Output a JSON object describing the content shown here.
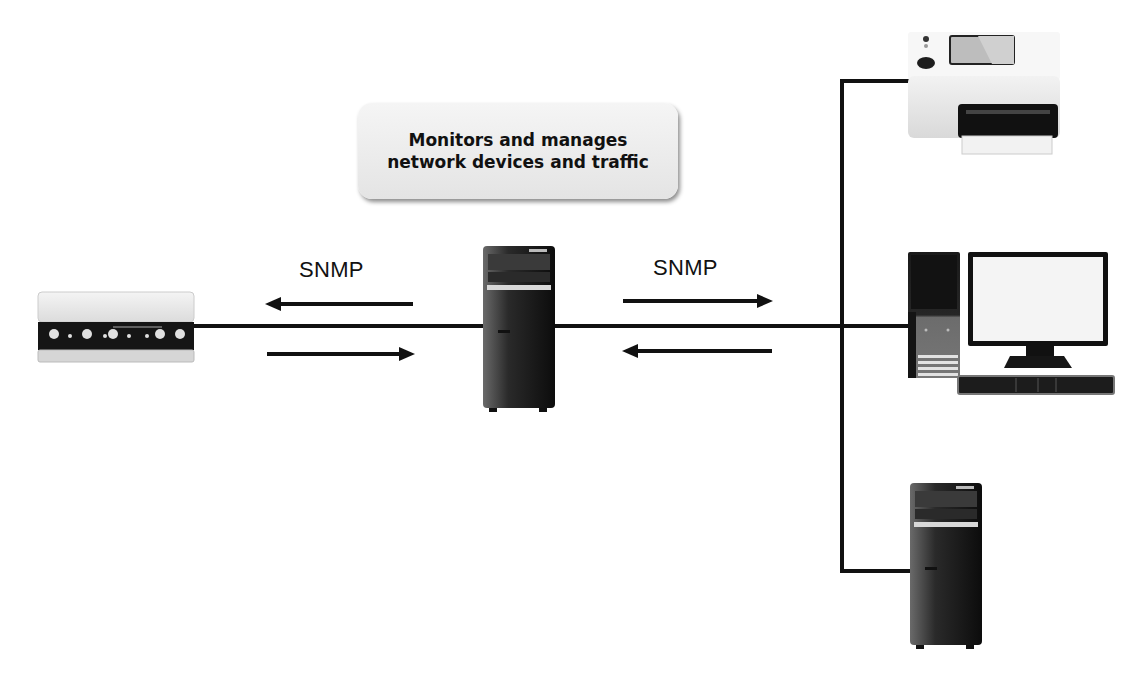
{
  "diagram": {
    "type": "network-topology",
    "callout": {
      "line1": "Monitors and manages",
      "line2": "network devices and traffic"
    },
    "labels": {
      "left_protocol": "SNMP",
      "right_protocol": "SNMP"
    },
    "nodes": [
      {
        "id": "network-device",
        "kind": "router/modem appliance",
        "position": "left"
      },
      {
        "id": "manager",
        "kind": "tower server (SNMP manager)",
        "position": "center"
      },
      {
        "id": "printer",
        "kind": "printer",
        "position": "right-top"
      },
      {
        "id": "workstation",
        "kind": "desktop computer with monitor and keyboard",
        "position": "right-middle"
      },
      {
        "id": "server",
        "kind": "tower computer",
        "position": "right-bottom"
      }
    ],
    "edges": [
      {
        "from": "network-device",
        "to": "manager",
        "protocol": "SNMP",
        "arrows": [
          "to-left",
          "to-right"
        ]
      },
      {
        "from": "manager",
        "to": "bus",
        "protocol": "SNMP",
        "arrows": [
          "to-right",
          "to-left"
        ]
      },
      {
        "from": "bus",
        "to": "printer"
      },
      {
        "from": "bus",
        "to": "workstation"
      },
      {
        "from": "bus",
        "to": "server"
      }
    ],
    "colors": {
      "line": "#111111",
      "callout_bg": "#ececec",
      "device_dark": "#1a1a1a",
      "device_light": "#e8e8e8"
    }
  }
}
